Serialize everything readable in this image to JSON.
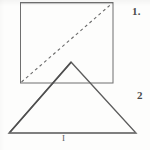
{
  "figure": {
    "background_color": "#fdfdfc",
    "stroke_color": "#6b6b6b",
    "stroke_color_dark": "#4a4a4a",
    "labels": {
      "square_label": "1.",
      "triangle_label": "2",
      "base_label": "I"
    },
    "shapes": [
      {
        "name": "square",
        "type": "rectangle",
        "x": 20,
        "y": 2,
        "width": 93,
        "height": 81,
        "stroke": "#6f6f6f",
        "stroke_width": 1,
        "fill": "none"
      },
      {
        "name": "square-diagonal",
        "type": "dashed-line",
        "x1": 21,
        "y1": 82,
        "x2": 112,
        "y2": 3,
        "stroke": "#6a6a6a",
        "stroke_width": 1.1,
        "dash": "3 3"
      },
      {
        "name": "triangle",
        "type": "polygon",
        "points": "71,62 136,133 9,133",
        "stroke": "#5c5c5c",
        "stroke_width": 1.3,
        "fill": "none"
      }
    ]
  }
}
